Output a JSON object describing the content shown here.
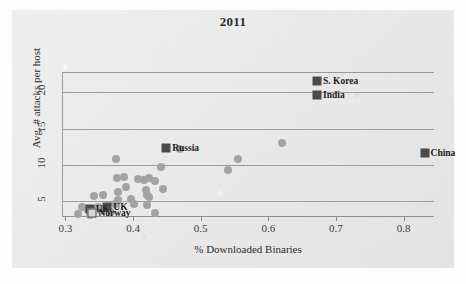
{
  "chart_data": {
    "type": "scatter",
    "title": "2011",
    "xlabel": "% Downloaded Binaries",
    "ylabel": "Avg. # attacks per host",
    "xlim": [
      0.295,
      0.845
    ],
    "ylim": [
      3.0,
      22.8
    ],
    "xticks": [
      "0.3",
      "0.4",
      "0.5",
      "0.6",
      "0.7",
      "0.8"
    ],
    "xtick_values": [
      0.3,
      0.4,
      0.5,
      0.6,
      0.7,
      0.8
    ],
    "yticks": [
      "5",
      "10",
      "15",
      "20"
    ],
    "ytick_values": [
      5,
      10,
      15,
      20
    ],
    "grid": "horizontal",
    "legend": "none",
    "labeled_points": [
      {
        "name": "S. Korea",
        "x": 0.672,
        "y": 21.6,
        "marker": "filled-square",
        "label_side": "right"
      },
      {
        "name": "India",
        "x": 0.672,
        "y": 19.7,
        "marker": "filled-square",
        "label_side": "right"
      },
      {
        "name": "China",
        "x": 0.831,
        "y": 11.7,
        "marker": "filled-square",
        "label_side": "right"
      },
      {
        "name": "Russia",
        "x": 0.449,
        "y": 12.3,
        "marker": "filled-square",
        "label_side": "right"
      },
      {
        "name": "UK",
        "x": 0.362,
        "y": 4.3,
        "marker": "filled-square",
        "label_side": "right"
      },
      {
        "name": "US",
        "x": 0.336,
        "y": 4.0,
        "marker": "filled-square",
        "label_side": "right"
      },
      {
        "name": "Norway",
        "x": 0.34,
        "y": 3.4,
        "marker": "open-square",
        "label_side": "right"
      }
    ],
    "unlabeled_points": [
      {
        "x": 0.62,
        "y": 13.0
      },
      {
        "x": 0.469,
        "y": 12.2
      },
      {
        "x": 0.555,
        "y": 10.9
      },
      {
        "x": 0.375,
        "y": 10.9
      },
      {
        "x": 0.54,
        "y": 9.3
      },
      {
        "x": 0.441,
        "y": 9.7
      },
      {
        "x": 0.377,
        "y": 8.2
      },
      {
        "x": 0.387,
        "y": 8.4
      },
      {
        "x": 0.408,
        "y": 8.1
      },
      {
        "x": 0.424,
        "y": 8.2
      },
      {
        "x": 0.433,
        "y": 7.8
      },
      {
        "x": 0.416,
        "y": 7.9
      },
      {
        "x": 0.389,
        "y": 7.0
      },
      {
        "x": 0.419,
        "y": 6.6
      },
      {
        "x": 0.444,
        "y": 6.7
      },
      {
        "x": 0.378,
        "y": 6.3
      },
      {
        "x": 0.421,
        "y": 5.9
      },
      {
        "x": 0.423,
        "y": 5.6
      },
      {
        "x": 0.355,
        "y": 5.9
      },
      {
        "x": 0.397,
        "y": 5.4
      },
      {
        "x": 0.342,
        "y": 5.7
      },
      {
        "x": 0.378,
        "y": 5.2
      },
      {
        "x": 0.402,
        "y": 4.6
      },
      {
        "x": 0.42,
        "y": 4.5
      },
      {
        "x": 0.373,
        "y": 4.6
      },
      {
        "x": 0.325,
        "y": 4.3
      },
      {
        "x": 0.348,
        "y": 4.2
      },
      {
        "x": 0.332,
        "y": 3.9
      },
      {
        "x": 0.352,
        "y": 3.7
      },
      {
        "x": 0.368,
        "y": 3.6
      },
      {
        "x": 0.432,
        "y": 3.4
      },
      {
        "x": 0.319,
        "y": 3.3
      },
      {
        "x": 0.337,
        "y": 3.2
      }
    ],
    "colors": {
      "dot": "#a3a3a3",
      "marker": "#4a4a4a",
      "grid": "#9e9e9e",
      "text": "#2b2b2b",
      "background": "#e9e9e9"
    }
  }
}
